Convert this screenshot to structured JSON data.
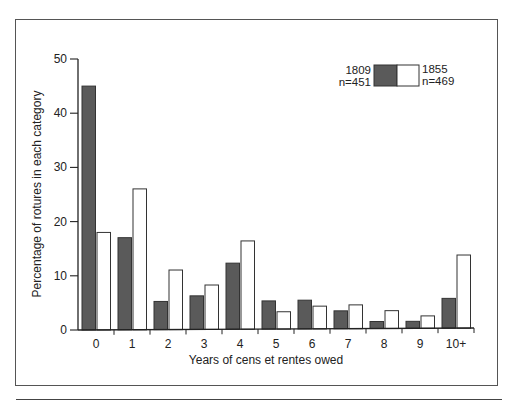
{
  "chart_data": {
    "type": "bar",
    "title": "",
    "xlabel": "Years of cens et rentes owed",
    "ylabel": "Percentage of rotures in each category",
    "categories": [
      "0",
      "1",
      "2",
      "3",
      "4",
      "5",
      "6",
      "7",
      "8",
      "9",
      "10+"
    ],
    "series": [
      {
        "name": "1809",
        "n_label": "n=451",
        "color": "#5a5a5a",
        "values": [
          45,
          17,
          5.2,
          6.2,
          12.2,
          5.2,
          5.3,
          3.3,
          1.3,
          1.3,
          5.5
        ]
      },
      {
        "name": "1855",
        "n_label": "n=469",
        "color": "#ffffff",
        "values": [
          18,
          26,
          11,
          8.2,
          16.3,
          3.2,
          4.2,
          4.4,
          3.3,
          2.3,
          13.5
        ]
      }
    ],
    "ylim": [
      0,
      50
    ],
    "yticks": [
      0,
      10,
      20,
      30,
      40,
      50
    ],
    "grid": false,
    "legend_position": "top-right"
  }
}
